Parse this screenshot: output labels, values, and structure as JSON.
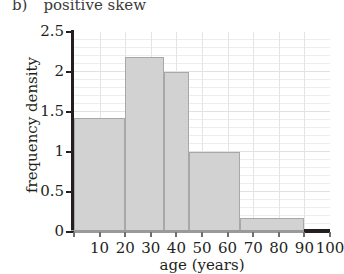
{
  "caption": {
    "label": "b)",
    "text": "positive skew"
  },
  "chart_data": {
    "type": "bar",
    "title": "positive skew",
    "xlabel": "age (years)",
    "ylabel": "frequency density",
    "xlim": [
      0,
      100
    ],
    "ylim": [
      0,
      2.5
    ],
    "grid": true,
    "legend": "none",
    "x_ticks": [
      0,
      10,
      20,
      30,
      40,
      50,
      60,
      70,
      80,
      90,
      100
    ],
    "x_tick_labels": [
      "",
      "10",
      "20",
      "30",
      "40",
      "50",
      "60",
      "70",
      "80",
      "90",
      "100"
    ],
    "y_ticks": [
      0,
      0.5,
      1,
      1.5,
      2,
      2.5
    ],
    "y_tick_labels": [
      "0",
      "0.5",
      "1",
      "1.5",
      "2",
      "2.5"
    ],
    "y_minor_step": 0.1,
    "bar_fill": "#d2d2d2",
    "bar_edge": "#a8a8a8",
    "bins": [
      {
        "start": 0,
        "end": 20,
        "value": 1.43
      },
      {
        "start": 20,
        "end": 35,
        "value": 2.19
      },
      {
        "start": 35,
        "end": 45,
        "value": 2.0
      },
      {
        "start": 45,
        "end": 65,
        "value": 1.0
      },
      {
        "start": 65,
        "end": 90,
        "value": 0.18
      },
      {
        "start": 90,
        "end": 100,
        "value": 0.0
      }
    ]
  }
}
